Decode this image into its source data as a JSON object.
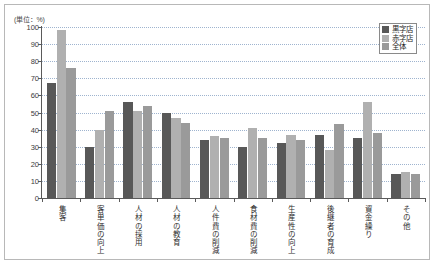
{
  "unit_label": "(単位：%)",
  "legend": {
    "position": "top-right",
    "items": [
      {
        "label": "黒字店",
        "color": "#585858"
      },
      {
        "label": "赤字店",
        "color": "#b0b0b0"
      },
      {
        "label": "全体",
        "color": "#9a9a9a"
      }
    ]
  },
  "axis": {
    "y_ticks": [
      "100",
      "90",
      "80",
      "70",
      "60",
      "50",
      "40",
      "30",
      "20",
      "10",
      "0"
    ]
  },
  "chart_data": {
    "type": "bar",
    "title": "",
    "subtitle": "",
    "xlabel": "",
    "ylabel": "(単位：%)",
    "ylim": [
      0,
      100
    ],
    "ytick_step": 10,
    "grid": true,
    "legend_position": "top-right",
    "categories": [
      "集客",
      "客単価の向上",
      "人材の採用",
      "人材の教育",
      "人件費の削減",
      "食材費の削減",
      "生産性の向上",
      "後継者の育成",
      "資金繰り",
      "その他"
    ],
    "series": [
      {
        "name": "黒字店",
        "color": "#585858",
        "values": [
          67,
          30,
          56,
          50,
          34,
          30,
          32,
          37,
          35,
          14
        ]
      },
      {
        "name": "赤字店",
        "color": "#b0b0b0",
        "values": [
          98,
          40,
          51,
          47,
          36,
          41,
          37,
          28,
          56,
          15
        ]
      },
      {
        "name": "全体",
        "color": "#9a9a9a",
        "values": [
          76,
          51,
          54,
          44,
          35,
          35,
          34,
          43,
          38,
          14
        ]
      }
    ]
  }
}
